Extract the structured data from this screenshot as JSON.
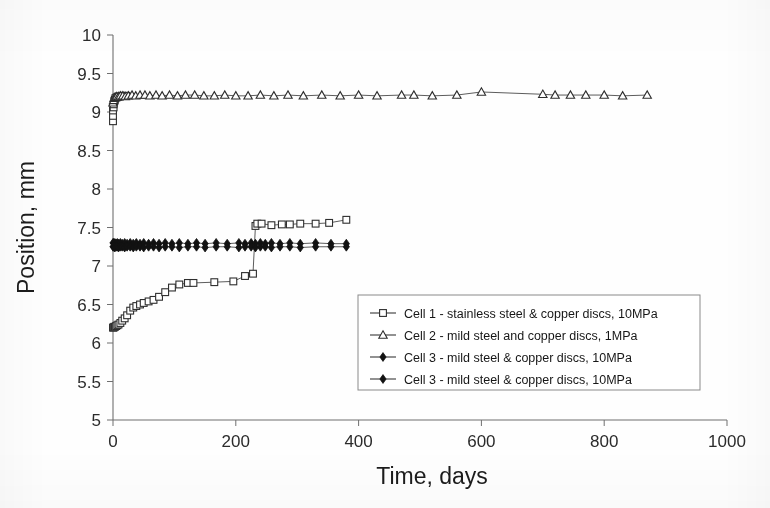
{
  "chart_data": {
    "type": "line",
    "title": "",
    "subtitle": "",
    "xlabel": "Time, days",
    "ylabel": "Position, mm",
    "xlim": [
      0,
      1000
    ],
    "ylim": [
      5,
      10
    ],
    "xticks": [
      0,
      200,
      400,
      600,
      800,
      1000
    ],
    "yticks": [
      5,
      5.5,
      6,
      6.5,
      7,
      7.5,
      8,
      8.5,
      9,
      9.5,
      10
    ],
    "xtick_labels": [
      "0",
      "200",
      "400",
      "600",
      "800",
      "1000"
    ],
    "ytick_labels": [
      "5",
      "5.5",
      "6",
      "6.5",
      "7",
      "7.5",
      "8",
      "8.5",
      "9",
      "9.5",
      "10"
    ],
    "grid": false,
    "legend_position": "lower-right-inside",
    "series": [
      {
        "name": "Cell 1 - stainless steel & copper discs, 10MPa",
        "marker": "open-square",
        "color": "#2e2e2e",
        "x": [
          0,
          1,
          2,
          3,
          5,
          7,
          9,
          12,
          15,
          19,
          23,
          28,
          33,
          38,
          44,
          50,
          58,
          66,
          75,
          85,
          96,
          108,
          122,
          131,
          165,
          196,
          215,
          228,
          232,
          235,
          242,
          258,
          275,
          288,
          305,
          330,
          352,
          380
        ],
        "y": [
          6.2,
          6.2,
          6.21,
          6.21,
          6.22,
          6.23,
          6.24,
          6.26,
          6.29,
          6.32,
          6.36,
          6.42,
          6.46,
          6.48,
          6.5,
          6.52,
          6.54,
          6.56,
          6.6,
          6.66,
          6.72,
          6.76,
          6.78,
          6.78,
          6.79,
          6.8,
          6.87,
          6.9,
          7.52,
          7.55,
          7.55,
          7.53,
          7.54,
          7.54,
          7.55,
          7.55,
          7.56,
          7.6
        ]
      },
      {
        "name": "Cell 1 - stainless steel & copper discs, 10MPa (initial high readings)",
        "marker": "open-square",
        "color": "#2e2e2e",
        "x": [
          0,
          0,
          0,
          1,
          1,
          2,
          3,
          4,
          6,
          8,
          11,
          14,
          18,
          22
        ],
        "y": [
          8.88,
          8.95,
          9.02,
          9.06,
          9.1,
          9.14,
          9.16,
          9.18,
          9.19,
          9.2,
          9.2,
          9.21,
          9.21,
          9.21
        ]
      },
      {
        "name": "Cell 2  - mild steel and copper discs, 1MPa",
        "marker": "open-triangle",
        "color": "#2e2e2e",
        "x": [
          0,
          1,
          2,
          4,
          6,
          9,
          12,
          16,
          20,
          25,
          31,
          37,
          44,
          52,
          60,
          70,
          80,
          92,
          105,
          118,
          133,
          148,
          165,
          182,
          200,
          220,
          240,
          262,
          285,
          310,
          340,
          370,
          400,
          430,
          470,
          490,
          520,
          560,
          600,
          700,
          720,
          745,
          770,
          800,
          830,
          870
        ],
        "y": [
          9.12,
          9.15,
          9.18,
          9.19,
          9.2,
          9.2,
          9.21,
          9.21,
          9.2,
          9.21,
          9.22,
          9.21,
          9.22,
          9.22,
          9.21,
          9.22,
          9.21,
          9.22,
          9.21,
          9.22,
          9.22,
          9.21,
          9.21,
          9.22,
          9.21,
          9.21,
          9.22,
          9.21,
          9.22,
          9.21,
          9.22,
          9.21,
          9.22,
          9.21,
          9.22,
          9.22,
          9.21,
          9.22,
          9.26,
          9.23,
          9.22,
          9.22,
          9.22,
          9.22,
          9.21,
          9.22
        ]
      },
      {
        "name": "Cell 3 - mild steel & copper discs, 10MPa",
        "marker": "solid-diamond",
        "color": "#121212",
        "x": [
          0,
          1,
          2,
          3,
          5,
          7,
          9,
          12,
          15,
          19,
          23,
          28,
          33,
          38,
          44,
          50,
          58,
          66,
          75,
          85,
          96,
          108,
          122,
          136,
          150,
          168,
          186,
          205,
          215,
          225,
          232,
          240,
          248,
          258,
          272,
          288,
          305,
          330,
          355,
          380
        ],
        "y": [
          7.3,
          7.3,
          7.29,
          7.3,
          7.29,
          7.3,
          7.29,
          7.3,
          7.29,
          7.3,
          7.29,
          7.3,
          7.29,
          7.3,
          7.29,
          7.3,
          7.29,
          7.3,
          7.29,
          7.3,
          7.29,
          7.3,
          7.29,
          7.3,
          7.29,
          7.3,
          7.29,
          7.3,
          7.29,
          7.3,
          7.29,
          7.3,
          7.29,
          7.3,
          7.29,
          7.3,
          7.29,
          7.3,
          7.29,
          7.29
        ]
      },
      {
        "name": "Cell 3 - mild steel & copper discs, 10MPa",
        "marker": "solid-diamond",
        "color": "#121212",
        "x": [
          0,
          1,
          2,
          3,
          5,
          7,
          9,
          12,
          15,
          19,
          23,
          28,
          33,
          38,
          44,
          50,
          58,
          66,
          75,
          85,
          96,
          108,
          122,
          136,
          150,
          168,
          186,
          205,
          215,
          225,
          232,
          240,
          248,
          258,
          272,
          288,
          305,
          330,
          355,
          380
        ],
        "y": [
          7.25,
          7.25,
          7.25,
          7.24,
          7.25,
          7.25,
          7.24,
          7.25,
          7.25,
          7.24,
          7.25,
          7.25,
          7.24,
          7.25,
          7.25,
          7.24,
          7.25,
          7.25,
          7.24,
          7.25,
          7.25,
          7.24,
          7.25,
          7.25,
          7.24,
          7.25,
          7.25,
          7.24,
          7.25,
          7.25,
          7.24,
          7.25,
          7.25,
          7.24,
          7.25,
          7.25,
          7.24,
          7.25,
          7.25,
          7.25
        ]
      }
    ],
    "legend": [
      {
        "label": "Cell 1 - stainless steel & copper discs, 10MPa",
        "marker": "open-square"
      },
      {
        "label": "Cell 2  - mild steel and copper discs, 1MPa",
        "marker": "open-triangle"
      },
      {
        "label": "Cell 3 - mild steel & copper discs, 10MPa",
        "marker": "solid-diamond"
      },
      {
        "label": "Cell 3 - mild steel & copper discs, 10MPa",
        "marker": "solid-diamond"
      }
    ]
  }
}
